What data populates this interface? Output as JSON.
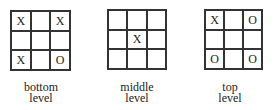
{
  "diagram": {
    "boards": [
      {
        "id": "bottom",
        "label_line1": "bottom",
        "label_line2": "level",
        "cells": [
          "X",
          "",
          "X",
          "",
          "",
          "",
          "X",
          "",
          "O"
        ]
      },
      {
        "id": "middle",
        "label_line1": "middle",
        "label_line2": "level",
        "cells": [
          "",
          "",
          "",
          "",
          "X",
          "",
          "",
          "",
          ""
        ]
      },
      {
        "id": "top",
        "label_line1": "top",
        "label_line2": "level",
        "cells": [
          "X",
          "",
          "O",
          "",
          "",
          "",
          "O",
          "",
          "O"
        ]
      }
    ],
    "colors": {
      "grid_line": "#333333",
      "text": "#222222",
      "background": "#ffffff"
    }
  }
}
